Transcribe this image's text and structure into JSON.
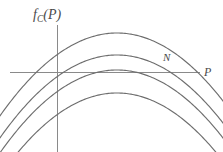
{
  "figure": {
    "background_color": "#ffffff",
    "line_color": "#6e6e6e",
    "axis_color": "#8a8a8a",
    "label_color": "#4a4a4a",
    "labels": {
      "y_axis": "f",
      "y_axis_subscript": "C",
      "y_axis_argument": "(P)",
      "point": "N",
      "x_axis": "P"
    }
  },
  "chart_data": {
    "type": "line",
    "title": "",
    "xlabel": "P",
    "ylabel": "f_C(P)",
    "grid": false,
    "legend": null,
    "annotations": [
      {
        "text": "N",
        "x": 168,
        "y": 60,
        "description": "label marking where the topmost parabola crosses the horizontal axis"
      },
      {
        "text": "f_C(P)",
        "x": 33,
        "y": 8,
        "description": "vertical axis label"
      },
      {
        "text": "P",
        "x": 204,
        "y": 66,
        "description": "horizontal axis label"
      }
    ],
    "axes": {
      "x_axis_pixel_y": 72,
      "x_axis_pixel_x_start": 10,
      "x_axis_pixel_x_end": 200,
      "y_axis_pixel_x": 57,
      "y_axis_pixel_y_start": 25,
      "y_axis_pixel_y_end": 152,
      "origin_pixel": [
        57,
        72
      ]
    },
    "xlim": [
      0,
      223
    ],
    "ylim": [
      152,
      0
    ],
    "series": [
      {
        "name": "curve-1",
        "description": "topmost parabola, crosses the horizontal axis at two points",
        "vertex": [
          117,
          33
        ],
        "curvature": 0.00605,
        "crosses_axis": true,
        "tangent_to_axis": false
      },
      {
        "name": "curve-2",
        "description": "second parabola, crosses the horizontal axis at two points",
        "vertex": [
          117,
          55
        ],
        "curvature": 0.00605,
        "crosses_axis": true,
        "tangent_to_axis": false
      },
      {
        "name": "curve-3",
        "description": "third parabola, tangent to the horizontal axis at its vertex",
        "vertex": [
          117,
          70
        ],
        "curvature": 0.00605,
        "crosses_axis": false,
        "tangent_to_axis": true
      },
      {
        "name": "curve-4",
        "description": "lowest parabola, lies entirely below the horizontal axis",
        "vertex": [
          117,
          93
        ],
        "curvature": 0.00605,
        "crosses_axis": false,
        "tangent_to_axis": false
      }
    ]
  }
}
